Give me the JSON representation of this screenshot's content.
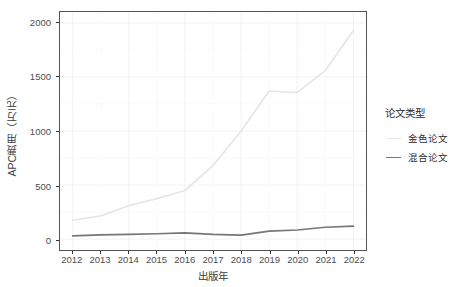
{
  "chart_data": {
    "type": "line",
    "title": "",
    "xlabel": "出版年",
    "ylabel": "APC费用（万元）",
    "x": [
      2012,
      2013,
      2014,
      2015,
      2016,
      2017,
      2018,
      2019,
      2020,
      2021,
      2022
    ],
    "categories": [
      "2012",
      "2013",
      "2014",
      "2015",
      "2016",
      "2017",
      "2018",
      "2019",
      "2020",
      "2021",
      "2022"
    ],
    "series": [
      {
        "name": "金色论文",
        "color": "#e6e6e6",
        "values": [
          175,
          215,
          310,
          375,
          450,
          680,
          1000,
          1370,
          1355,
          1560,
          1930
        ]
      },
      {
        "name": "混合论文",
        "color": "#767676",
        "values": [
          30,
          40,
          45,
          50,
          58,
          45,
          38,
          75,
          85,
          110,
          120
        ]
      }
    ],
    "ylim": [
      0,
      2000
    ],
    "yticks": [
      0,
      500,
      1000,
      1500,
      2000
    ],
    "ytick_labels": [
      "0",
      "500",
      "1000",
      "1500",
      "2000"
    ],
    "xlim": [
      2012,
      2022
    ],
    "grid": true,
    "grid_color": "#f2f2f2",
    "legend": {
      "position": "right",
      "title": "论文类型",
      "entries": [
        "金色论文",
        "混合论文"
      ]
    },
    "panel_background": "#ffffff",
    "panel_border_color": "#545454"
  }
}
